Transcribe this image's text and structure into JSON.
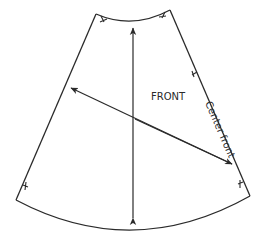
{
  "diagram": {
    "type": "pattern-piece",
    "piece_label": "FRONT",
    "edge_label": "Center front",
    "colors": {
      "stroke": "#2a2a2a",
      "background": "#ffffff"
    },
    "elements": [
      "waist-curve",
      "hem-curve",
      "side-seam",
      "center-front-edge",
      "vertical-grainline-arrow",
      "diagonal-bias-arrow",
      "notch-marks"
    ]
  }
}
